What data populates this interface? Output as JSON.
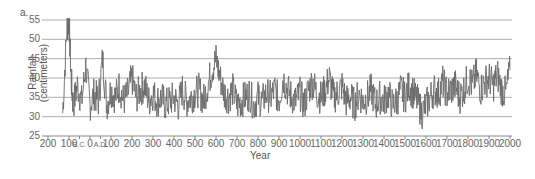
{
  "chart_data": {
    "type": "line",
    "panel_label": "a.",
    "title": "",
    "xlabel": "Year",
    "ylabel_line1": "Rainfall",
    "ylabel_line2": "(centimeters)",
    "ylim": [
      25,
      55
    ],
    "xlim": [
      -150,
      2000
    ],
    "grid": "horizontal",
    "y_ticks": [
      "55",
      "50",
      "45",
      "40",
      "35",
      "30",
      "25"
    ],
    "x_ticks": [
      {
        "label": "200",
        "year": -200
      },
      {
        "label": "100",
        "year": -100
      },
      {
        "label": "B.C.",
        "year": -50,
        "small": true
      },
      {
        "label": "0",
        "year": 0
      },
      {
        "label": "A.D.",
        "year": 50,
        "small": true
      },
      {
        "label": "100",
        "year": 100
      },
      {
        "label": "200",
        "year": 200
      },
      {
        "label": "300",
        "year": 300
      },
      {
        "label": "400",
        "year": 400
      },
      {
        "label": "500",
        "year": 500
      },
      {
        "label": "600",
        "year": 600
      },
      {
        "label": "700",
        "year": 700
      },
      {
        "label": "800",
        "year": 800
      },
      {
        "label": "900",
        "year": 900
      },
      {
        "label": "1000",
        "year": 1000
      },
      {
        "label": "1100",
        "year": 1100
      },
      {
        "label": "1200",
        "year": 1200
      },
      {
        "label": "1300",
        "year": 1300
      },
      {
        "label": "1400",
        "year": 1400
      },
      {
        "label": "1500",
        "year": 1500
      },
      {
        "label": "1600",
        "year": 1600
      },
      {
        "label": "1700",
        "year": 1700
      },
      {
        "label": "1800",
        "year": 1800
      },
      {
        "label": "1900",
        "year": 1900
      },
      {
        "label": "2000",
        "year": 2000
      }
    ],
    "series": [
      {
        "name": "Rainfall",
        "color": "#666666",
        "x": [
          -130,
          -110,
          -100,
          -90,
          -80,
          -60,
          -40,
          -20,
          0,
          20,
          40,
          60,
          80,
          100,
          120,
          140,
          160,
          180,
          200,
          220,
          240,
          260,
          280,
          300,
          320,
          340,
          360,
          380,
          400,
          420,
          440,
          460,
          480,
          500,
          520,
          540,
          560,
          580,
          600,
          620,
          640,
          660,
          680,
          700,
          720,
          740,
          760,
          780,
          800,
          820,
          840,
          860,
          880,
          900,
          920,
          940,
          960,
          980,
          1000,
          1020,
          1040,
          1060,
          1080,
          1100,
          1120,
          1140,
          1160,
          1180,
          1200,
          1220,
          1240,
          1260,
          1280,
          1300,
          1320,
          1340,
          1360,
          1380,
          1400,
          1420,
          1440,
          1460,
          1480,
          1500,
          1520,
          1540,
          1560,
          1580,
          1600,
          1620,
          1640,
          1660,
          1680,
          1700,
          1720,
          1740,
          1760,
          1780,
          1800,
          1820,
          1840,
          1860,
          1880,
          1900,
          1920,
          1940,
          1960,
          1980,
          2000
        ],
        "values": [
          31,
          53,
          55,
          40,
          33,
          38,
          34,
          43,
          33,
          36,
          34,
          45,
          33,
          37,
          35,
          38,
          34,
          36,
          40,
          35,
          37,
          38,
          34,
          36,
          34,
          35,
          33,
          34,
          35,
          33,
          37,
          34,
          35,
          36,
          37,
          34,
          38,
          42,
          45,
          40,
          36,
          35,
          37,
          33,
          34,
          35,
          36,
          33,
          35,
          34,
          36,
          35,
          37,
          34,
          40,
          37,
          35,
          34,
          36,
          33,
          37,
          39,
          36,
          35,
          37,
          40,
          35,
          36,
          38,
          34,
          35,
          33,
          36,
          34,
          35,
          37,
          33,
          35,
          34,
          36,
          33,
          34,
          37,
          35,
          38,
          36,
          34,
          31,
          33,
          35,
          37,
          36,
          39,
          36,
          37,
          38,
          35,
          37,
          40,
          38,
          41,
          37,
          39,
          40,
          38,
          41,
          37,
          36,
          42
        ]
      }
    ]
  }
}
